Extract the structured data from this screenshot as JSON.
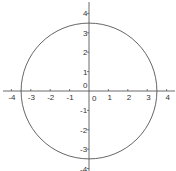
{
  "chart_data": {
    "type": "line",
    "title": "",
    "xlabel": "",
    "ylabel": "",
    "series": [
      {
        "name": "circle",
        "center": [
          0,
          0
        ],
        "radius": 3.5
      }
    ],
    "xlim": [
      -4.5,
      4.5
    ],
    "ylim": [
      -4.2,
      4.4
    ],
    "x_ticks": [
      -4,
      -3,
      -2,
      -1,
      0,
      1,
      2,
      3,
      4
    ],
    "y_ticks": [
      4,
      3,
      2,
      1,
      0,
      -1,
      -2,
      -3,
      -4
    ],
    "x_tick_labels": [
      "-4",
      "-3",
      "-2",
      "-1",
      "0",
      "1",
      "2",
      "3",
      "4"
    ],
    "y_tick_labels": [
      "4",
      "3",
      "2",
      "1",
      "0",
      "-1",
      "-2",
      "-3",
      "-4"
    ],
    "grid": false,
    "legend": "none"
  },
  "style": {
    "axis_color": "#444444",
    "curve_color": "#555555",
    "text_color": "#333333"
  }
}
